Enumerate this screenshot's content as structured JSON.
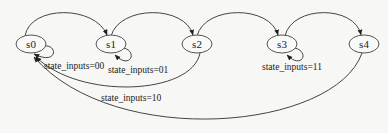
{
  "diagram": {
    "type": "state-machine",
    "background": "#f7f7f5",
    "nodes": [
      {
        "id": "s0",
        "label": "s0",
        "cx": 31,
        "cy": 44
      },
      {
        "id": "s1",
        "label": "s1",
        "cx": 111,
        "cy": 44
      },
      {
        "id": "s2",
        "label": "s2",
        "cx": 197,
        "cy": 44
      },
      {
        "id": "s3",
        "label": "s3",
        "cx": 282,
        "cy": 44
      },
      {
        "id": "s4",
        "label": "s4",
        "cx": 364,
        "cy": 44
      }
    ],
    "edges": [
      {
        "from": "s0",
        "to": "s1",
        "label": ""
      },
      {
        "from": "s1",
        "to": "s2",
        "label": ""
      },
      {
        "from": "s2",
        "to": "s3",
        "label": ""
      },
      {
        "from": "s3",
        "to": "s4",
        "label": ""
      },
      {
        "from": "s0",
        "to": "s0",
        "label": "state_inputs=00"
      },
      {
        "from": "s1",
        "to": "s1",
        "label": "state_inputs=01"
      },
      {
        "from": "s2",
        "to": "s0",
        "label": "state_inputs=10"
      },
      {
        "from": "s3",
        "to": "s3",
        "label": "state_inputs=11"
      },
      {
        "from": "s4",
        "to": "s0",
        "label": ""
      }
    ]
  }
}
